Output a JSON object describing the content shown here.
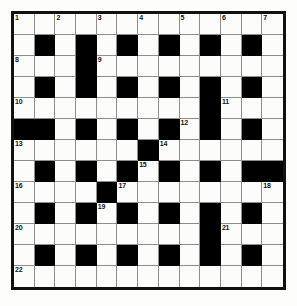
{
  "puzzle": {
    "type": "crossword-grid",
    "columns": 13,
    "rows": 13,
    "colors": {
      "page_background": "#fdfdfc",
      "cell_background": "#fcfcfa",
      "block_background": "#000000",
      "grid_line": "#8e8e8e",
      "frame": "#111111",
      "number_text": "#141414"
    },
    "blocks": [
      [
        1,
        1
      ],
      [
        1,
        3
      ],
      [
        1,
        5
      ],
      [
        1,
        7
      ],
      [
        1,
        9
      ],
      [
        1,
        11
      ],
      [
        2,
        3
      ],
      [
        3,
        1
      ],
      [
        3,
        3
      ],
      [
        3,
        5
      ],
      [
        3,
        7
      ],
      [
        3,
        9
      ],
      [
        3,
        11
      ],
      [
        4,
        9
      ],
      [
        5,
        0
      ],
      [
        5,
        1
      ],
      [
        5,
        3
      ],
      [
        5,
        5
      ],
      [
        5,
        7
      ],
      [
        5,
        9
      ],
      [
        5,
        11
      ],
      [
        6,
        6
      ],
      [
        7,
        1
      ],
      [
        7,
        3
      ],
      [
        7,
        5
      ],
      [
        7,
        7
      ],
      [
        7,
        9
      ],
      [
        7,
        11
      ],
      [
        7,
        12
      ],
      [
        8,
        4
      ],
      [
        9,
        1
      ],
      [
        9,
        3
      ],
      [
        9,
        5
      ],
      [
        9,
        7
      ],
      [
        9,
        9
      ],
      [
        9,
        11
      ],
      [
        10,
        9
      ],
      [
        11,
        1
      ],
      [
        11,
        3
      ],
      [
        11,
        5
      ],
      [
        11,
        7
      ],
      [
        11,
        9
      ],
      [
        11,
        11
      ]
    ],
    "numbers": [
      {
        "row": 0,
        "col": 0,
        "label": "1"
      },
      {
        "row": 0,
        "col": 2,
        "label": "2"
      },
      {
        "row": 0,
        "col": 4,
        "label": "3"
      },
      {
        "row": 0,
        "col": 6,
        "label": "4"
      },
      {
        "row": 0,
        "col": 8,
        "label": "5"
      },
      {
        "row": 0,
        "col": 10,
        "label": "6"
      },
      {
        "row": 0,
        "col": 12,
        "label": "7"
      },
      {
        "row": 2,
        "col": 0,
        "label": "8"
      },
      {
        "row": 2,
        "col": 4,
        "label": "9"
      },
      {
        "row": 4,
        "col": 0,
        "label": "10"
      },
      {
        "row": 4,
        "col": 10,
        "label": "11"
      },
      {
        "row": 5,
        "col": 8,
        "label": "12"
      },
      {
        "row": 6,
        "col": 0,
        "label": "13"
      },
      {
        "row": 6,
        "col": 7,
        "label": "14"
      },
      {
        "row": 7,
        "col": 6,
        "label": "15"
      },
      {
        "row": 8,
        "col": 0,
        "label": "16"
      },
      {
        "row": 8,
        "col": 5,
        "label": "17"
      },
      {
        "row": 8,
        "col": 12,
        "label": "18"
      },
      {
        "row": 9,
        "col": 4,
        "label": "19"
      },
      {
        "row": 10,
        "col": 0,
        "label": "20"
      },
      {
        "row": 10,
        "col": 10,
        "label": "21"
      },
      {
        "row": 12,
        "col": 0,
        "label": "22"
      }
    ]
  }
}
